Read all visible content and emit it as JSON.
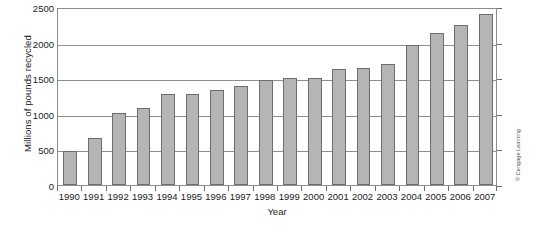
{
  "chart_data": {
    "type": "bar",
    "title": "",
    "xlabel": "Year",
    "ylabel": "Millions of pounds recycled",
    "categories": [
      "1990",
      "1991",
      "1992",
      "1993",
      "1994",
      "1995",
      "1996",
      "1997",
      "1998",
      "1999",
      "2000",
      "2001",
      "2002",
      "2003",
      "2004",
      "2005",
      "2006",
      "2007"
    ],
    "values": [
      480,
      660,
      1010,
      1080,
      1280,
      1280,
      1330,
      1390,
      1480,
      1500,
      1510,
      1630,
      1640,
      1700,
      1960,
      2140,
      2250,
      2400
    ],
    "ylim": [
      0,
      2500
    ],
    "yticks": [
      0,
      500,
      1000,
      1500,
      2000,
      2500
    ],
    "ytick_labels": [
      "0",
      "500",
      "1000",
      "1500",
      "2000",
      "2500"
    ],
    "grid": true,
    "legend": null,
    "bar_color": "#b5b5b5",
    "bar_edge_color": "#6d6d6d",
    "axis_color": "#8e8e8e"
  },
  "credit": "© Cengage Learning"
}
